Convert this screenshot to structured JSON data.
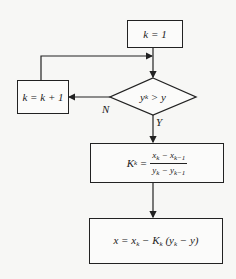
{
  "diagram": {
    "type": "flowchart",
    "nodes": {
      "init": {
        "shape": "rect",
        "text": "k = 1"
      },
      "increment": {
        "shape": "rect",
        "text": "k = k + 1"
      },
      "decision": {
        "shape": "diamond",
        "text": "y_k > y",
        "lhs": "y",
        "lhs_sub": "k",
        "op": " > ",
        "rhs": "y"
      },
      "slope": {
        "shape": "rect",
        "text": "K_k = (x_k − x_{k−1}) / (y_k − y_{k−1})",
        "lhs": "K",
        "lhs_sub": "k",
        "eq": " =",
        "num_a": "x",
        "num_a_sub": "k",
        "num_op": " − ",
        "num_b": "x",
        "num_b_sub": "k−1",
        "den_a": "y",
        "den_a_sub": "k",
        "den_op": " − ",
        "den_b": "y",
        "den_b_sub": "k−1"
      },
      "result": {
        "shape": "rect",
        "text": "x = x_k − K_k (y_k − y)",
        "p1": "x = x",
        "p1_sub": "k",
        "p2": " − K",
        "p2_sub": "k",
        "p3": " (y",
        "p3_sub": "k",
        "p4": " − y)"
      }
    },
    "edges": [
      {
        "from": "init",
        "to": "decision"
      },
      {
        "from": "decision",
        "to": "increment",
        "label": "N"
      },
      {
        "from": "increment",
        "to": "decision",
        "note": "loop back"
      },
      {
        "from": "decision",
        "to": "slope",
        "label": "Y"
      },
      {
        "from": "slope",
        "to": "result"
      }
    ],
    "labels": {
      "no": "N",
      "yes": "Y"
    },
    "colors": {
      "stroke": "#222222",
      "background": "#f7f7f5"
    }
  }
}
